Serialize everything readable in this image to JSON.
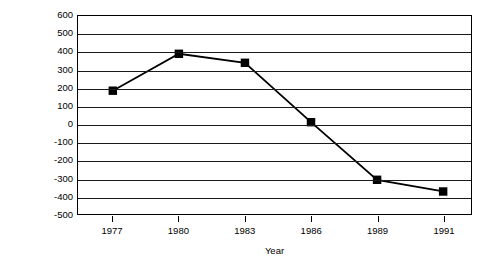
{
  "chart_data": {
    "type": "line",
    "title": "",
    "subtitle": "",
    "xlabel": "Year",
    "ylabel": "Billions of dollars",
    "categories": [
      "1977",
      "1980",
      "1983",
      "1986",
      "1989",
      "1991"
    ],
    "values": [
      185,
      390,
      340,
      10,
      -310,
      -375
    ],
    "series": [
      {
        "name": "Billions of dollars",
        "values": [
          185,
          390,
          340,
          10,
          -310,
          -375
        ]
      }
    ],
    "ylim": [
      -500,
      600
    ],
    "ytick_step": 100,
    "yticks": [
      600,
      500,
      400,
      300,
      200,
      100,
      0,
      -100,
      -200,
      -300,
      -400,
      -500
    ],
    "ytick_labels": [
      "600",
      "500",
      "400",
      "300",
      "200",
      "100",
      "0",
      "-100",
      "-200",
      "-300",
      "-400",
      "-500"
    ],
    "xtick_labels": [
      "1977",
      "1980",
      "1983",
      "1986",
      "1989",
      "1991"
    ],
    "grid": {
      "horizontal": true,
      "vertical": false
    },
    "legend": {
      "visible": false,
      "position": "none"
    },
    "marker": "filled-square",
    "colors": {
      "line": "#000000",
      "marker": "#000000",
      "grid": "#1a1a1a",
      "axis": "#000000",
      "background": "#ffffff"
    }
  }
}
